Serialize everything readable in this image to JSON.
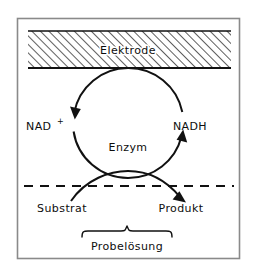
{
  "figure": {
    "colors": {
      "line": "#111111",
      "frame": "#7a7a7a",
      "hatch": "#1a1a1a",
      "background": "#ffffff"
    },
    "frame": {
      "name": "diagram-border",
      "x": 17,
      "y": 18,
      "width": 223,
      "height": 241
    },
    "electrode": {
      "label": "Elektrode",
      "hatch_direction": "forward-slash",
      "band": {
        "x": 28,
        "y": 31,
        "width": 203,
        "height": 37
      },
      "label_pos": {
        "x": 128,
        "y": 54
      }
    },
    "cycle": {
      "center": {
        "x": 128,
        "y": 123
      },
      "radius": 55,
      "enzyme_label": "Enzym",
      "enzyme_label_pos": {
        "x": 128,
        "y": 147
      },
      "left_species": "NAD",
      "left_species_superscript": "+",
      "left_label_pos": {
        "x": 46,
        "y": 126
      },
      "right_species": "NADH",
      "right_label_pos": {
        "x": 178,
        "y": 126
      },
      "left_arrow_direction": "down",
      "right_arrow_direction": "up"
    },
    "solution": {
      "boundary_style": "dashed",
      "boundary_y": 186,
      "boundary_x1": 24,
      "boundary_x2": 234,
      "substrate_label": "Substrat",
      "substrate_label_pos": {
        "x": 60,
        "y": 208
      },
      "product_label": "Produkt",
      "product_label_pos": {
        "x": 156,
        "y": 208
      },
      "bracket_label": "Probelösung",
      "bracket_label_pos": {
        "x": 127,
        "y": 248
      },
      "bracket": {
        "x1": 82,
        "x2": 172,
        "y": 235,
        "peak_x": 127
      },
      "reaction_arrow_direction": "down-right"
    }
  }
}
